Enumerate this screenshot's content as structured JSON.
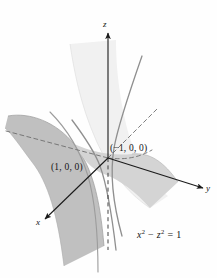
{
  "figure": {
    "name": "hyperbolic-cylinder-surface",
    "equation_label": {
      "base1": "x",
      "exp1": "2",
      "minus": " − ",
      "base2": "z",
      "exp2": "2",
      "equals": " = 1"
    },
    "equation_plain": "x² − z² = 1",
    "axes": [
      {
        "id": "z",
        "label": "z",
        "direction": "up"
      },
      {
        "id": "y",
        "label": "y",
        "direction": "right"
      },
      {
        "id": "x",
        "label": "x",
        "direction": "lower-left"
      }
    ],
    "points": [
      {
        "id": "p-front",
        "label": "(1, 0, 0)"
      },
      {
        "id": "p-back",
        "label": "(−1, 0, 0)"
      }
    ],
    "colors": {
      "background": "#fefefe",
      "axis": "#1a1a1a",
      "sheet_near_fill": "#bdbdbd",
      "sheet_far_fill": "#f0f0f0",
      "sheet_mid_fill": "#d6d6d6",
      "trace_curve": "#8c8c8c",
      "dashed_guide": "#6e6e6e",
      "text": "#151515"
    }
  }
}
